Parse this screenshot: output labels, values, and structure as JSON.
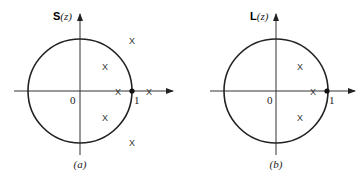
{
  "panels": [
    {
      "id": "a",
      "function_symbol": "S",
      "function_arg": "(z)",
      "caption": "(a)",
      "origin_label": "0",
      "unit_label": "1",
      "cross_glyph": "X",
      "crosses": [
        {
          "re": 0.48,
          "im": 0.48
        },
        {
          "re": 0.48,
          "im": -0.48
        },
        {
          "re": 0.73,
          "im": 0
        },
        {
          "re": 1.0,
          "im": 0.98
        },
        {
          "re": 1.0,
          "im": -0.98
        },
        {
          "re": 1.33,
          "im": 0
        }
      ],
      "marked_point": {
        "re": 1,
        "im": 0
      }
    },
    {
      "id": "b",
      "function_symbol": "L",
      "function_arg": "(z)",
      "caption": "(b)",
      "origin_label": "0",
      "unit_label": "1",
      "cross_glyph": "X",
      "crosses": [
        {
          "re": 0.46,
          "im": 0.48
        },
        {
          "re": 0.46,
          "im": -0.48
        },
        {
          "re": 0.71,
          "im": 0
        }
      ],
      "marked_point": {
        "re": 1,
        "im": 0
      }
    }
  ]
}
